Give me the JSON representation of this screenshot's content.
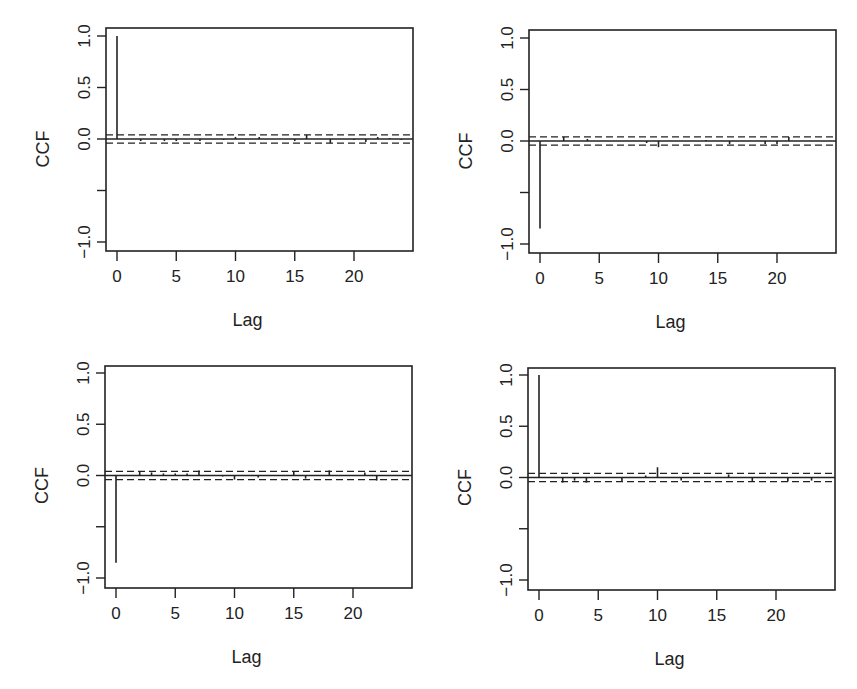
{
  "chart_data": [
    {
      "type": "bar",
      "title": "",
      "panel": "top-left",
      "xlabel": "Lag",
      "ylabel": "CCF",
      "ylim": [
        -1.05,
        1.05
      ],
      "xlim": [
        -0.9,
        24.9
      ],
      "xticks": [
        "0",
        "5",
        "10",
        "15",
        "20"
      ],
      "yticks": [
        "-1.0",
        "0.5",
        "0.0",
        "0.5",
        "1.0"
      ],
      "ytick_labels": [
        "−1.0",
        "",
        "0.0",
        "0.5",
        "1.0"
      ],
      "conf_bound": 0.04,
      "lags": [
        0,
        1,
        2,
        3,
        4,
        5,
        6,
        7,
        8,
        9,
        10,
        11,
        12,
        13,
        14,
        15,
        16,
        17,
        18,
        19,
        20,
        21,
        22,
        23,
        24
      ],
      "values": [
        1.0,
        0.0,
        -0.02,
        0.0,
        -0.02,
        -0.02,
        0.0,
        -0.02,
        0.0,
        -0.01,
        0.02,
        0.0,
        0.02,
        0.0,
        0.0,
        -0.02,
        0.04,
        0.0,
        -0.04,
        0.0,
        -0.01,
        -0.03,
        0.02,
        0.01,
        -0.01
      ]
    },
    {
      "type": "bar",
      "title": "",
      "panel": "top-right",
      "xlabel": "Lag",
      "ylabel": "CCF",
      "ylim": [
        -1.05,
        1.05
      ],
      "xlim": [
        -0.9,
        24.9
      ],
      "xticks": [
        "0",
        "5",
        "10",
        "15",
        "20"
      ],
      "ytick_labels": [
        "−1.0",
        "",
        "0.0",
        "0.5",
        "1.0"
      ],
      "conf_bound": 0.04,
      "lags": [
        0,
        1,
        2,
        3,
        4,
        5,
        6,
        7,
        8,
        9,
        10,
        11,
        12,
        13,
        14,
        15,
        16,
        17,
        18,
        19,
        20,
        21,
        22,
        23,
        24
      ],
      "values": [
        -0.85,
        0.0,
        0.04,
        0.0,
        0.02,
        0.0,
        0.0,
        0.0,
        0.0,
        -0.02,
        -0.06,
        0.0,
        0.0,
        0.0,
        0.01,
        0.0,
        -0.03,
        0.0,
        0.0,
        -0.03,
        -0.03,
        0.04,
        0.0,
        0.0,
        0.0
      ]
    },
    {
      "type": "bar",
      "title": "",
      "panel": "bottom-left",
      "xlabel": "Lag",
      "ylabel": "CCF",
      "ylim": [
        -1.05,
        1.05
      ],
      "xlim": [
        -0.9,
        24.9
      ],
      "xticks": [
        "0",
        "5",
        "10",
        "15",
        "20"
      ],
      "ytick_labels": [
        "−1.0",
        "",
        "0.0",
        "0.5",
        "1.0"
      ],
      "conf_bound": 0.04,
      "lags": [
        0,
        1,
        2,
        3,
        4,
        5,
        6,
        7,
        8,
        9,
        10,
        11,
        12,
        13,
        14,
        15,
        16,
        17,
        18,
        19,
        20,
        21,
        22,
        23,
        24
      ],
      "values": [
        -0.85,
        0.0,
        0.04,
        0.03,
        0.02,
        0.02,
        0.02,
        0.05,
        0.0,
        -0.01,
        -0.04,
        0.0,
        -0.02,
        0.0,
        0.0,
        0.04,
        -0.03,
        0.0,
        0.05,
        0.0,
        0.0,
        0.03,
        -0.05,
        0.0,
        0.0
      ]
    },
    {
      "type": "bar",
      "title": "",
      "panel": "bottom-right",
      "xlabel": "Lag",
      "ylabel": "CCF",
      "ylim": [
        -1.05,
        1.05
      ],
      "xlim": [
        -0.9,
        24.9
      ],
      "xticks": [
        "0",
        "5",
        "10",
        "15",
        "20"
      ],
      "ytick_labels": [
        "−1.0",
        "",
        "0.0",
        "0.5",
        "1.0"
      ],
      "conf_bound": 0.04,
      "lags": [
        0,
        1,
        2,
        3,
        4,
        5,
        6,
        7,
        8,
        9,
        10,
        11,
        12,
        13,
        14,
        15,
        16,
        17,
        18,
        19,
        20,
        21,
        22,
        23,
        24
      ],
      "values": [
        1.0,
        0.0,
        -0.05,
        -0.03,
        -0.05,
        0.0,
        0.0,
        -0.04,
        0.0,
        0.02,
        0.1,
        0.0,
        -0.03,
        0.0,
        0.0,
        0.0,
        0.03,
        0.0,
        -0.04,
        0.0,
        0.0,
        -0.04,
        0.0,
        -0.03,
        0.0
      ]
    }
  ],
  "panels": [
    {
      "ylabel": "CCF",
      "xlabel": "Lag"
    },
    {
      "ylabel": "CCF",
      "xlabel": "Lag"
    },
    {
      "ylabel": "CCF",
      "xlabel": "Lag"
    },
    {
      "ylabel": "CCF",
      "xlabel": "Lag"
    }
  ]
}
